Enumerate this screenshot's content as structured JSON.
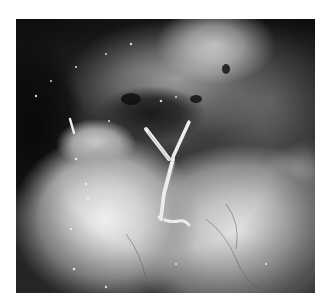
{
  "image": {
    "description": "Grayscale intraoperative photograph showing tissue with suture strands tied in a Y-shape",
    "alt": "Surgical field photograph"
  }
}
